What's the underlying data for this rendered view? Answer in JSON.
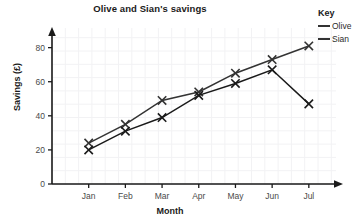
{
  "chart_data": {
    "type": "line",
    "title": "Olive and Sian's savings",
    "xlabel": "Month",
    "ylabel": "Savings (£)",
    "categories": [
      "Jan",
      "Feb",
      "Mar",
      "Apr",
      "May",
      "Jun",
      "Jul"
    ],
    "ylim": [
      0,
      88
    ],
    "yticks": [
      0,
      20,
      40,
      60,
      80
    ],
    "ytick_labels": [
      "0",
      "20",
      "40",
      "60",
      "80"
    ],
    "grid": true,
    "legend_position": "right",
    "legend_title": "Key",
    "marker": "x",
    "series": [
      {
        "name": "Olive",
        "color": "#333333",
        "values": [
          24,
          35,
          49,
          54,
          65,
          73,
          81
        ]
      },
      {
        "name": "Sian",
        "color": "#1a1a1a",
        "values": [
          20,
          31,
          39,
          52,
          59,
          67,
          47
        ]
      }
    ]
  },
  "legend": {
    "title": "Key",
    "items": [
      {
        "label": "Olive"
      },
      {
        "label": "Sian"
      }
    ]
  },
  "axes": {
    "y_title": "Savings (£)",
    "x_title": "Month"
  }
}
